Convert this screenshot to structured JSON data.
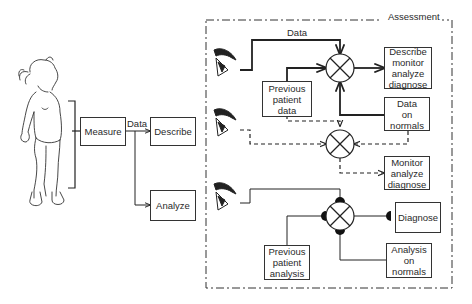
{
  "assessment": {
    "title": "Assessment"
  },
  "left_flow": {
    "measure": "Measure",
    "data_label": "Data",
    "describe": "Describe",
    "analyze": "Analyze"
  },
  "top_path": {
    "data_label": "Data",
    "previous_patient_data": "Previous\npatient\ndata",
    "output": "Describe\nmonitor\nanalyze\ndiagnose",
    "normals": "Data\non\nnormals"
  },
  "middle_path": {
    "output": "Monitor\nanalyze\ndiagnose"
  },
  "bottom_path": {
    "previous_patient_analysis": "Previous\npatient\nanalysis",
    "output": "Diagnose",
    "normals": "Analysis\non\nnormals"
  },
  "icons": {
    "child": "child-figure-icon",
    "eye": "eye-icon",
    "comparator": "comparator-circle-x-icon"
  },
  "colors": {
    "line": "#222222",
    "background": "#ffffff"
  }
}
